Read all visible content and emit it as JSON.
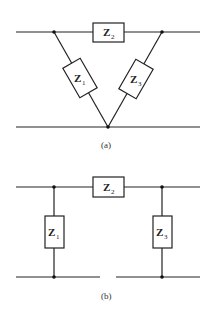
{
  "diagram_a": {
    "caption": "(a)",
    "impedances": [
      {
        "id": "Z1",
        "symbol": "Z",
        "subscript": "1"
      },
      {
        "id": "Z2",
        "symbol": "Z",
        "subscript": "2"
      },
      {
        "id": "Z3",
        "symbol": "Z",
        "subscript": "3"
      }
    ],
    "topology": "delta/triangle (V-shaped) network between two lines"
  },
  "diagram_b": {
    "caption": "(b)",
    "impedances": [
      {
        "id": "Z1",
        "symbol": "Z",
        "subscript": "1"
      },
      {
        "id": "Z2",
        "symbol": "Z",
        "subscript": "2"
      },
      {
        "id": "Z3",
        "symbol": "Z",
        "subscript": "3"
      }
    ],
    "topology": "pi network between two lines"
  },
  "colors": {
    "line": "#222222",
    "background": "#ffffff"
  }
}
